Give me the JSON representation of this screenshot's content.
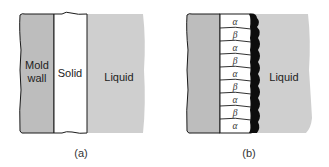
{
  "colors": {
    "mold_wall": "#bdbdbd",
    "liquid": "#cfcfcf",
    "solid": "#ffffff",
    "outline": "#1a1a1a",
    "dendrite": "#0d0d0d"
  },
  "panel_a": {
    "caption": "(a)",
    "mold_wall_label_line1": "Mold",
    "mold_wall_label_line2": "wall",
    "solid_label": "Solid",
    "liquid_label": "Liquid"
  },
  "panel_b": {
    "caption": "(b)",
    "liquid_label": "Liquid",
    "phases": [
      "α",
      "β",
      "α",
      "β",
      "α",
      "β",
      "α",
      "β",
      "α"
    ]
  }
}
